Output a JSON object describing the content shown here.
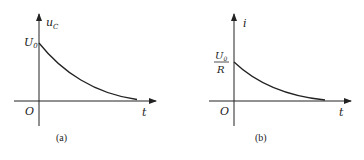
{
  "figures": [
    {
      "id": "a",
      "caption": "(a)",
      "y_axis_label": "u",
      "y_axis_label_sub": "C",
      "x_axis_label": "t",
      "origin_label": "O",
      "initial_value_label": "U",
      "initial_value_sub": "0",
      "curve": "exponential decay"
    },
    {
      "id": "b",
      "caption": "(b)",
      "y_axis_label": "i",
      "x_axis_label": "t",
      "origin_label": "O",
      "initial_value_numerator": "U",
      "initial_value_numerator_sub": "0",
      "initial_value_denominator": "R",
      "curve": "exponential decay"
    }
  ],
  "colors": {
    "ink": "#222222",
    "background": "#ffffff"
  }
}
